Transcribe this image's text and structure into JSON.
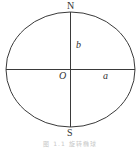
{
  "diagram": {
    "labels": {
      "north": "N",
      "south": "S",
      "origin": "O",
      "semi_major": "a",
      "semi_minor": "b"
    },
    "caption": "图 1.1  旋转椭球",
    "colors": {
      "stroke": "#3a3a3a",
      "text": "#333333",
      "caption": "#c8c8c8"
    }
  }
}
